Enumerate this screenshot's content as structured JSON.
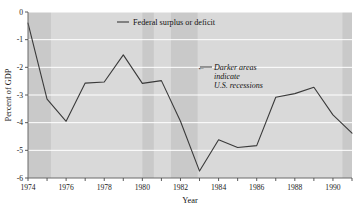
{
  "chart_data": {
    "type": "line",
    "title": "",
    "xlabel": "Year",
    "ylabel": "Percent of GDP",
    "xlim": [
      1974,
      1991
    ],
    "ylim": [
      -6,
      0
    ],
    "grid": true,
    "grid_color": "#ffffff",
    "plot_background": "#d9d9d9",
    "recession_band_color": "#c9c9c9",
    "line_color": "#3a3a3a",
    "legend_position": "top-center",
    "x": [
      1974,
      1975,
      1976,
      1977,
      1978,
      1979,
      1980,
      1981,
      1982,
      1983,
      1984,
      1985,
      1986,
      1987,
      1988,
      1989,
      1990,
      1991
    ],
    "series": [
      {
        "name": "Federal surplus or deficit",
        "values": [
          -0.4,
          -3.15,
          -3.95,
          -2.57,
          -2.53,
          -1.55,
          -2.58,
          -2.48,
          -3.95,
          -5.75,
          -4.62,
          -4.9,
          -4.83,
          -3.08,
          -2.95,
          -2.72,
          -3.72,
          -4.38
        ]
      }
    ],
    "xticks": [
      1974,
      1975,
      1976,
      1977,
      1978,
      1979,
      1980,
      1981,
      1982,
      1983,
      1984,
      1985,
      1986,
      1987,
      1988,
      1989,
      1990,
      1991
    ],
    "xtick_labels": [
      "1974",
      "",
      "1976",
      "",
      "1978",
      "",
      "1980",
      "",
      "1982",
      "",
      "1984",
      "",
      "1986",
      "",
      "1988",
      "",
      "1990",
      ""
    ],
    "yticks": [
      0,
      -1,
      -2,
      -3,
      -4,
      -5,
      -6
    ],
    "ytick_labels": [
      "0",
      "-1",
      "-2",
      "-3",
      "-4",
      "-5",
      "-6"
    ],
    "recession_bands": [
      {
        "start": 1974.0,
        "end": 1975.2
      },
      {
        "start": 1980.0,
        "end": 1980.6
      },
      {
        "start": 1981.5,
        "end": 1982.9
      },
      {
        "start": 1990.5,
        "end": 1991.0
      }
    ],
    "annotations": [
      {
        "name": "recession-note",
        "lines": [
          "Darker areas",
          "indicate",
          "U.S. recessions"
        ],
        "arrow": "←",
        "style": "italic"
      }
    ]
  },
  "legend": {
    "entries": [
      {
        "label": "Federal surplus or deficit",
        "marker": "line"
      }
    ]
  },
  "axes": {
    "x_title": "Year",
    "y_title": "Percent of GDP"
  }
}
